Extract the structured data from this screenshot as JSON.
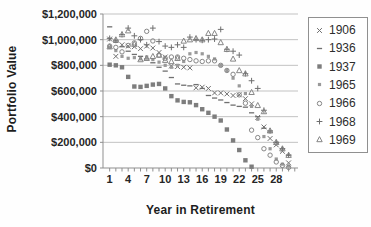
{
  "chart_data": {
    "type": "scatter",
    "title": "",
    "xlabel": "Year in Retirement",
    "ylabel": "Portfolio Value",
    "x_tick_labels": [
      1,
      4,
      7,
      10,
      13,
      16,
      19,
      22,
      25,
      28
    ],
    "x_minor_tick_every": 1,
    "x_range": [
      0,
      31
    ],
    "ylim": [
      0,
      1200000
    ],
    "grid": "horizontal",
    "legend_position": "right",
    "y_ticks": [
      {
        "value": 1200000,
        "label": "$1,200,000"
      },
      {
        "value": 1000000,
        "label": "$1,000,000"
      },
      {
        "value": 800000,
        "label": "$800,000"
      },
      {
        "value": 600000,
        "label": "$600,000"
      },
      {
        "value": 400000,
        "label": "$400,000"
      },
      {
        "value": 200000,
        "label": "$200,000"
      },
      {
        "value": 0,
        "label": "$0"
      }
    ],
    "series": [
      {
        "name": "1906",
        "marker": "x",
        "color": "#6f6f6f",
        "values": [
          1005000,
          870000,
          960000,
          950000,
          945000,
          930000,
          950000,
          935000,
          900000,
          865000,
          795000,
          790000,
          785000,
          780000,
          625000,
          630000,
          620000,
          585000,
          585000,
          577000,
          565000,
          570000,
          540000,
          500000,
          395000,
          320000,
          230000,
          180000,
          130000,
          40000
        ]
      },
      {
        "name": "1936",
        "marker": "dash",
        "color": "#6f6f6f",
        "values": [
          1100000,
          980000,
          945000,
          910000,
          885000,
          870000,
          850000,
          820000,
          785000,
          755000,
          705000,
          655000,
          645000,
          640000,
          650000,
          620000,
          565000,
          545000,
          530000,
          510000,
          490000,
          480000,
          474000,
          430000,
          400000,
          310000,
          280000,
          200000,
          150000,
          100000
        ]
      },
      {
        "name": "1937",
        "marker": "square",
        "color": "#7d7d7d",
        "values": [
          805000,
          800000,
          785000,
          710000,
          635000,
          632000,
          640000,
          650000,
          655000,
          620000,
          560000,
          527000,
          515000,
          512000,
          490000,
          458000,
          430000,
          400000,
          370000,
          300000,
          215000,
          140000,
          60000,
          10000
        ]
      },
      {
        "name": "1965",
        "marker": "square-small",
        "color": "#9a9a9a",
        "values": [
          940000,
          915000,
          870000,
          855000,
          860000,
          850000,
          865000,
          845000,
          825000,
          800000,
          785000,
          800000,
          830000,
          890000,
          900000,
          890000,
          870000,
          850000,
          800000,
          760000,
          700000,
          640000,
          580000,
          480000,
          380000,
          245000,
          150000,
          70000,
          30000,
          15000
        ]
      },
      {
        "name": "1966",
        "marker": "circle",
        "color": "#868686",
        "values": [
          950000,
          940000,
          905000,
          955000,
          975000,
          1010000,
          1065000,
          990000,
          880000,
          855000,
          865000,
          865000,
          855000,
          845000,
          835000,
          830000,
          835000,
          835000,
          800000,
          760000,
          730000,
          570000,
          505000,
          295000,
          237000,
          150000,
          100000,
          47000,
          20000,
          5000
        ]
      },
      {
        "name": "1968",
        "marker": "plus",
        "color": "#6f6f6f",
        "values": [
          1010000,
          995000,
          1040000,
          1090000,
          1030000,
          1000000,
          960000,
          1090000,
          985000,
          950000,
          940000,
          960000,
          940000,
          1020000,
          1000000,
          995000,
          1000000,
          1005000,
          1080000,
          925000,
          910000,
          880000,
          735000,
          680000,
          620000,
          450000,
          290000,
          200000,
          150000,
          100000
        ]
      },
      {
        "name": "1969",
        "marker": "triangle",
        "color": "#868686",
        "values": [
          945000,
          1000000,
          1040000,
          1070000,
          965000,
          845000,
          855000,
          870000,
          880000,
          840000,
          830000,
          855000,
          990000,
          1000000,
          1010000,
          1000000,
          1050000,
          1050000,
          978000,
          925000,
          850000,
          760000,
          735000,
          590000,
          488000,
          440000,
          290000,
          200000,
          150000,
          100000
        ]
      }
    ],
    "style": {
      "grid_color": "#c2c2c2",
      "axis_color": "#8f8f8f",
      "tick_label_color": "#262626",
      "background": "#fefefe"
    }
  }
}
